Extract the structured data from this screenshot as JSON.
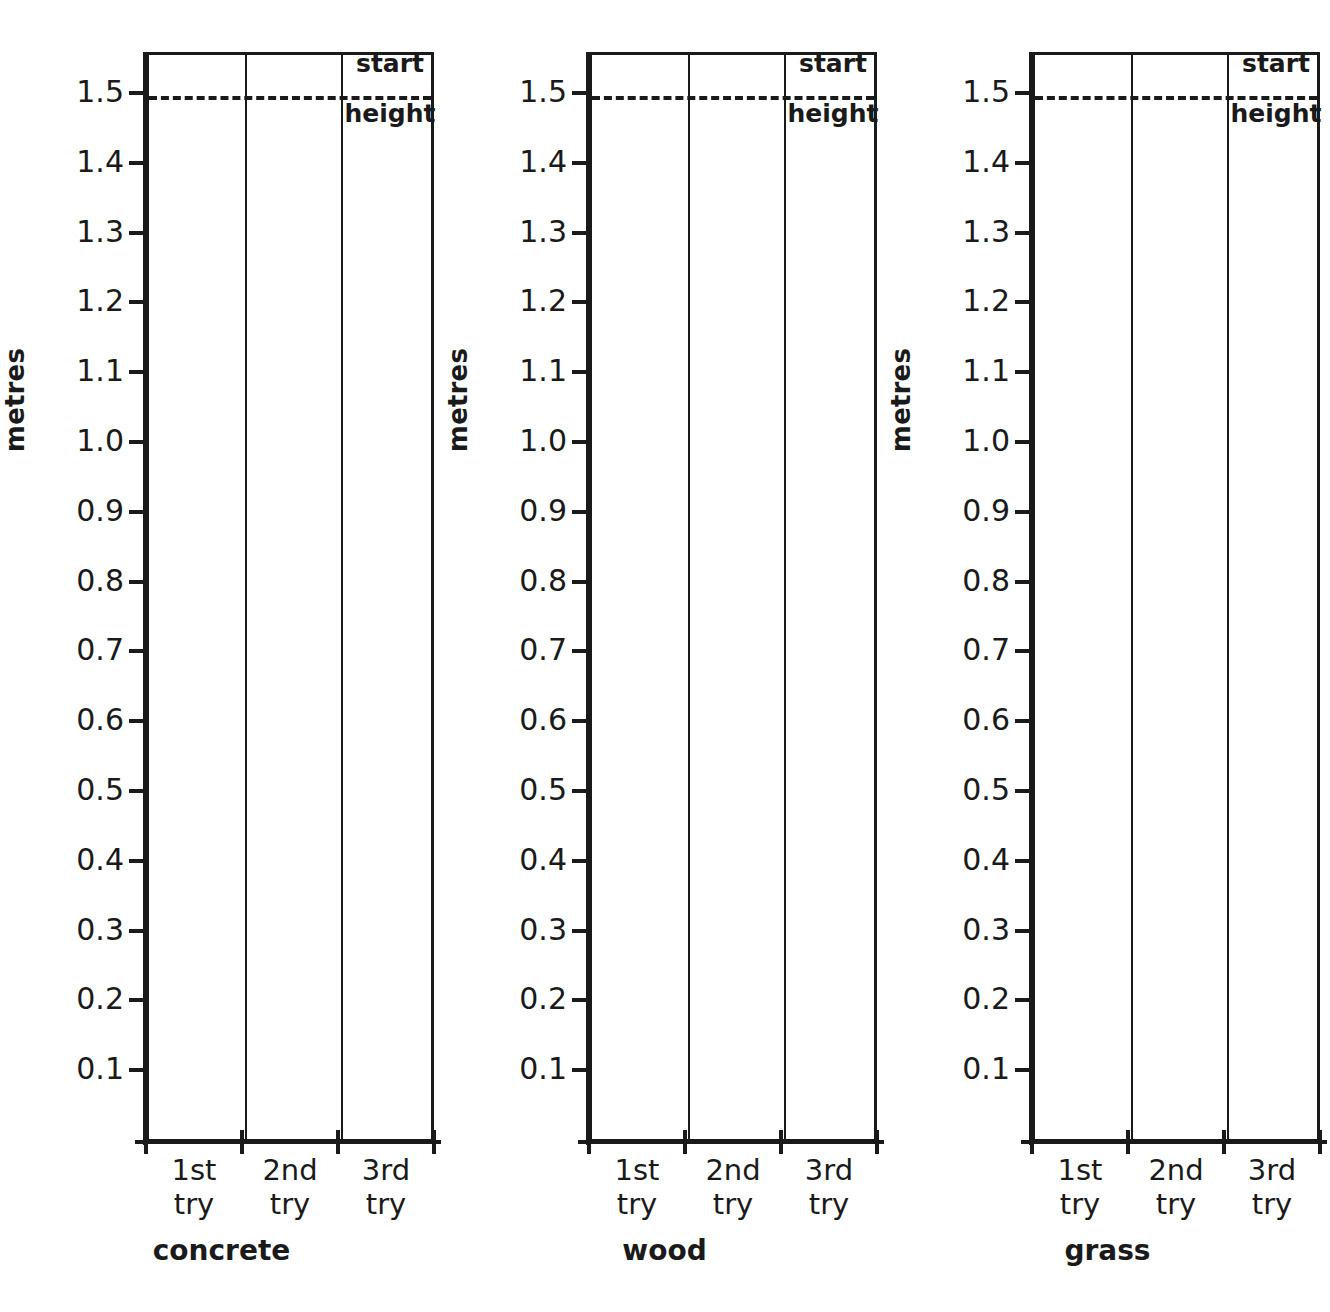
{
  "chart_data": {
    "type": "table",
    "ylabel": "metres",
    "ylim": [
      0.0,
      1.55
    ],
    "ytick_labels": [
      "1.5",
      "1.4",
      "1.3",
      "1.2",
      "1.1",
      "1.0",
      "0.9",
      "0.8",
      "0.7",
      "0.6",
      "0.5",
      "0.4",
      "0.3",
      "0.2",
      "0.1"
    ],
    "ytick_values": [
      1.5,
      1.4,
      1.3,
      1.2,
      1.1,
      1.0,
      0.9,
      0.8,
      0.7,
      0.6,
      0.5,
      0.4,
      0.3,
      0.2,
      0.1
    ],
    "categories": [
      "1st try",
      "2nd try",
      "3rd try"
    ],
    "grid": false,
    "legend": false,
    "reference_line": {
      "value": 1.5,
      "style": "dashed",
      "label_line1": "start",
      "label_line2": "height"
    },
    "panels": [
      {
        "title": "concrete",
        "series": [
          {
            "name": "bounce height",
            "values": [
              null,
              null,
              null
            ]
          }
        ]
      },
      {
        "title": "wood",
        "series": [
          {
            "name": "bounce height",
            "values": [
              null,
              null,
              null
            ]
          }
        ]
      },
      {
        "title": "grass",
        "series": [
          {
            "name": "bounce height",
            "values": [
              null,
              null,
              null
            ]
          }
        ]
      }
    ],
    "colors": {
      "ink": "#1a1a1a",
      "background": "#ffffff"
    }
  },
  "panels": [
    {
      "title": "concrete",
      "ylabel": "metres",
      "start_top": "start",
      "start_bottom": "height",
      "xticks": [
        {
          "line1": "1st",
          "line2": "try"
        },
        {
          "line1": "2nd",
          "line2": "try"
        },
        {
          "line1": "3rd",
          "line2": "try"
        }
      ],
      "yticks": [
        "1.5",
        "1.4",
        "1.3",
        "1.2",
        "1.1",
        "1.0",
        "0.9",
        "0.8",
        "0.7",
        "0.6",
        "0.5",
        "0.4",
        "0.3",
        "0.2",
        "0.1"
      ]
    },
    {
      "title": "wood",
      "ylabel": "metres",
      "start_top": "start",
      "start_bottom": "height",
      "xticks": [
        {
          "line1": "1st",
          "line2": "try"
        },
        {
          "line1": "2nd",
          "line2": "try"
        },
        {
          "line1": "3rd",
          "line2": "try"
        }
      ],
      "yticks": [
        "1.5",
        "1.4",
        "1.3",
        "1.2",
        "1.1",
        "1.0",
        "0.9",
        "0.8",
        "0.7",
        "0.6",
        "0.5",
        "0.4",
        "0.3",
        "0.2",
        "0.1"
      ]
    },
    {
      "title": "grass",
      "ylabel": "metres",
      "start_top": "start",
      "start_bottom": "height",
      "xticks": [
        {
          "line1": "1st",
          "line2": "try"
        },
        {
          "line1": "2nd",
          "line2": "try"
        },
        {
          "line1": "3rd",
          "line2": "try"
        }
      ],
      "yticks": [
        "1.5",
        "1.4",
        "1.3",
        "1.2",
        "1.1",
        "1.0",
        "0.9",
        "0.8",
        "0.7",
        "0.6",
        "0.5",
        "0.4",
        "0.3",
        "0.2",
        "0.1"
      ]
    }
  ]
}
